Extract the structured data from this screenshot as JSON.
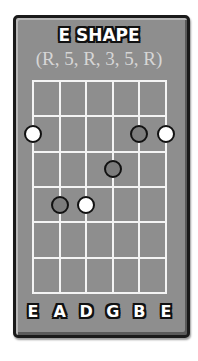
{
  "title": "E SHAPE",
  "subtitle": "(R, 5, R, 3, 5, R)",
  "fretboard": {
    "strings": 6,
    "frets": 6,
    "string_names": [
      "E",
      "A",
      "D",
      "G",
      "B",
      "E"
    ],
    "dots": [
      {
        "string": 1,
        "fret": 2,
        "interval": "R",
        "type": "root"
      },
      {
        "string": 5,
        "fret": 2,
        "interval": "3",
        "type": "other"
      },
      {
        "string": 6,
        "fret": 2,
        "interval": "R",
        "type": "root"
      },
      {
        "string": 4,
        "fret": 3,
        "interval": "R",
        "type": "other"
      },
      {
        "string": 2,
        "fret": 4,
        "interval": "5",
        "type": "other"
      },
      {
        "string": 3,
        "fret": 4,
        "interval": "R",
        "type": "root"
      }
    ]
  },
  "colors": {
    "card": "#8e8e8e",
    "grid": "#f4f4f4",
    "root_dot": "#ffffff",
    "other_dot": "#7c7c7c",
    "outline": "#111111"
  }
}
